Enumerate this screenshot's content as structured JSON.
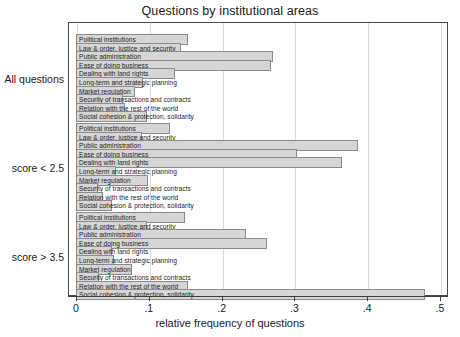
{
  "chart_data": {
    "type": "bar",
    "orientation": "horizontal",
    "title": "Questions by institutional areas",
    "xlabel": "relative frequency of questions",
    "ylabel": "",
    "xlim": [
      0,
      0.5
    ],
    "xticks": [
      0,
      0.1,
      0.2,
      0.3,
      0.4,
      0.5
    ],
    "xtick_labels": [
      "0",
      ".1",
      ".2",
      ".3",
      ".4",
      ".5"
    ],
    "grid": true,
    "legend": "none",
    "categories": [
      "Political institutions",
      "Law & order, justice and security",
      "Public administration",
      "Ease of doing business",
      "Dealing with land rights",
      "Long-term and strategic planning",
      "Market regulation",
      "Security of transactions and contracts",
      "Relation with the rest of the world",
      "Social cohesion & protection, solidarity"
    ],
    "groups": [
      {
        "name": "All questions",
        "values": [
          0.154,
          0.144,
          0.27,
          0.268,
          0.136,
          0.092,
          0.081,
          0.064,
          0.067,
          0.097
        ]
      },
      {
        "name": "score < 2.5",
        "values": [
          0.129,
          0.09,
          0.387,
          0.304,
          0.365,
          0.055,
          0.099,
          0.03,
          0.037,
          0.05
        ]
      },
      {
        "name": "score > 3.5",
        "values": [
          0.15,
          0.098,
          0.234,
          0.262,
          0.049,
          0.052,
          0.077,
          0.031,
          0.154,
          0.479
        ]
      }
    ]
  },
  "colors": {
    "bar_fill": "#d6d6d6",
    "bar_stroke": "#8a8a8a",
    "frame": "#4a4a4a",
    "grid": "#d9d9d9",
    "text": "#1a1a1a"
  }
}
